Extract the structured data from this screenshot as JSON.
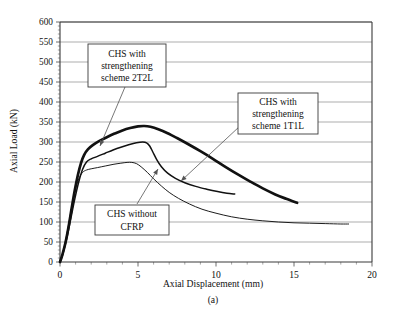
{
  "figure": {
    "subcaption": "(a)"
  },
  "chart_data": {
    "type": "line",
    "title": "",
    "xlabel": "Axial Displacement (mm)",
    "ylabel": "Axial Load (kN)",
    "xlim": [
      0,
      20
    ],
    "ylim": [
      0,
      600
    ],
    "xticks": [
      0,
      5,
      10,
      15,
      20
    ],
    "xtick_labels": [
      "0",
      "5",
      "10",
      "15",
      "20"
    ],
    "x_minor_tick_step": 1,
    "yticks": [
      0,
      50,
      100,
      150,
      200,
      250,
      300,
      350,
      400,
      450,
      500,
      550,
      600
    ],
    "ytick_labels": [
      "0",
      "50",
      "100",
      "150",
      "200",
      "250",
      "300",
      "350",
      "400",
      "450",
      "500",
      "550",
      "600"
    ],
    "grid": "horizontal",
    "legend": "annotations",
    "series": [
      {
        "name": "CHS with strengthening scheme 2T2L",
        "style": "thick",
        "points": [
          [
            0.0,
            0
          ],
          [
            0.15,
            18
          ],
          [
            0.35,
            48
          ],
          [
            0.55,
            88
          ],
          [
            0.75,
            135
          ],
          [
            0.95,
            180
          ],
          [
            1.15,
            218
          ],
          [
            1.35,
            248
          ],
          [
            1.55,
            268
          ],
          [
            1.8,
            282
          ],
          [
            2.1,
            292
          ],
          [
            2.5,
            302
          ],
          [
            3.0,
            312
          ],
          [
            3.5,
            321
          ],
          [
            4.0,
            329
          ],
          [
            4.5,
            335
          ],
          [
            5.0,
            339
          ],
          [
            5.4,
            340
          ],
          [
            5.8,
            338
          ],
          [
            6.3,
            332
          ],
          [
            6.9,
            322
          ],
          [
            7.5,
            310
          ],
          [
            8.2,
            295
          ],
          [
            9.0,
            277
          ],
          [
            9.8,
            258
          ],
          [
            10.6,
            238
          ],
          [
            11.4,
            219
          ],
          [
            12.2,
            201
          ],
          [
            13.0,
            184
          ],
          [
            13.8,
            169
          ],
          [
            14.5,
            158
          ],
          [
            15.2,
            148
          ]
        ]
      },
      {
        "name": "CHS with strengthening scheme 1T1L",
        "style": "medium",
        "points": [
          [
            0.0,
            0
          ],
          [
            0.2,
            22
          ],
          [
            0.45,
            62
          ],
          [
            0.7,
            110
          ],
          [
            0.95,
            158
          ],
          [
            1.2,
            200
          ],
          [
            1.45,
            232
          ],
          [
            1.7,
            250
          ],
          [
            2.0,
            258
          ],
          [
            2.4,
            264
          ],
          [
            2.9,
            272
          ],
          [
            3.4,
            280
          ],
          [
            3.9,
            287
          ],
          [
            4.4,
            293
          ],
          [
            4.9,
            298
          ],
          [
            5.3,
            300
          ],
          [
            5.55,
            298
          ],
          [
            5.75,
            290
          ],
          [
            5.95,
            275
          ],
          [
            6.2,
            256
          ],
          [
            6.5,
            238
          ],
          [
            6.9,
            222
          ],
          [
            7.4,
            209
          ],
          [
            8.0,
            198
          ],
          [
            8.7,
            189
          ],
          [
            9.4,
            182
          ],
          [
            10.1,
            176
          ],
          [
            10.7,
            172
          ],
          [
            11.2,
            170
          ]
        ]
      },
      {
        "name": "CHS without CFRP",
        "style": "thin",
        "points": [
          [
            0.0,
            0
          ],
          [
            0.2,
            25
          ],
          [
            0.45,
            72
          ],
          [
            0.7,
            126
          ],
          [
            0.95,
            175
          ],
          [
            1.2,
            208
          ],
          [
            1.45,
            224
          ],
          [
            1.7,
            230
          ],
          [
            2.0,
            233
          ],
          [
            2.4,
            236
          ],
          [
            2.9,
            240
          ],
          [
            3.4,
            244
          ],
          [
            3.9,
            247
          ],
          [
            4.3,
            249
          ],
          [
            4.6,
            249
          ],
          [
            4.9,
            246
          ],
          [
            5.2,
            238
          ],
          [
            5.6,
            224
          ],
          [
            6.0,
            208
          ],
          [
            6.5,
            190
          ],
          [
            7.0,
            174
          ],
          [
            7.6,
            159
          ],
          [
            8.3,
            145
          ],
          [
            9.1,
            132
          ],
          [
            10.0,
            122
          ],
          [
            11.0,
            113
          ],
          [
            12.0,
            107
          ],
          [
            13.0,
            103
          ],
          [
            14.0,
            100
          ],
          [
            15.0,
            98
          ],
          [
            16.0,
            97
          ],
          [
            17.0,
            96
          ],
          [
            18.0,
            95
          ],
          [
            18.5,
            95
          ]
        ]
      }
    ],
    "annotations": [
      {
        "id": "callout-2t2l",
        "lines": [
          "CHS with",
          "strengthening",
          "scheme 2T2L"
        ],
        "box": [
          88,
          44,
          78,
          43
        ],
        "leader_from": [
          125,
          87
        ],
        "leader_to": [
          100,
          146
        ]
      },
      {
        "id": "callout-1t1l",
        "lines": [
          "CHS with",
          "strengthening",
          "scheme 1T1L"
        ],
        "box": [
          238,
          93,
          80,
          41
        ],
        "leader_from": [
          240,
          126
        ],
        "leader_to": [
          181,
          181
        ]
      },
      {
        "id": "callout-no-cfrp",
        "lines": [
          "CHS without",
          "CFRP"
        ],
        "box": [
          95,
          205,
          74,
          30
        ],
        "leader_from": [
          137,
          204
        ],
        "leader_to": [
          158,
          169
        ]
      }
    ]
  }
}
